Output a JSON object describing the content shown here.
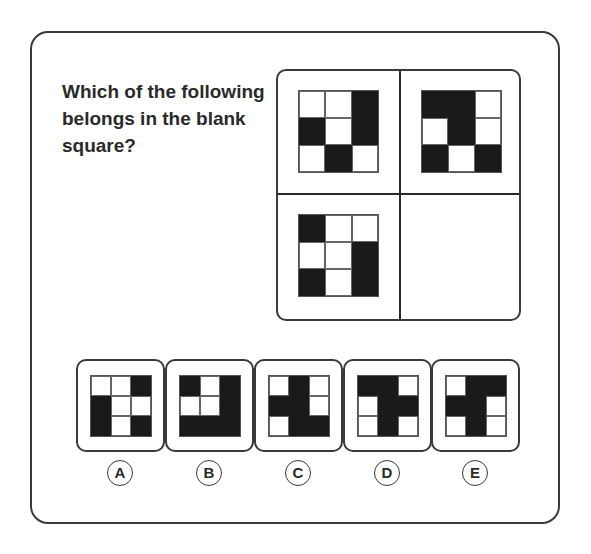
{
  "question": "Which of the following belongs in the blank square?",
  "colors": {
    "filled": "#1a1a1a",
    "empty": "#ffffff",
    "border": "#3a3a3a"
  },
  "matrix": {
    "top_left": [
      [
        0,
        0,
        1
      ],
      [
        1,
        0,
        1
      ],
      [
        0,
        1,
        0
      ]
    ],
    "top_right": [
      [
        1,
        1,
        0
      ],
      [
        0,
        1,
        0
      ],
      [
        1,
        0,
        1
      ]
    ],
    "bottom_left": [
      [
        1,
        0,
        0
      ],
      [
        0,
        0,
        1
      ],
      [
        1,
        0,
        1
      ]
    ],
    "bottom_right": "blank"
  },
  "options": [
    {
      "letter": "A",
      "pattern": [
        [
          0,
          0,
          1
        ],
        [
          1,
          0,
          0
        ],
        [
          1,
          0,
          1
        ]
      ]
    },
    {
      "letter": "B",
      "pattern": [
        [
          1,
          0,
          1
        ],
        [
          0,
          0,
          1
        ],
        [
          1,
          1,
          1
        ]
      ]
    },
    {
      "letter": "C",
      "pattern": [
        [
          0,
          1,
          0
        ],
        [
          1,
          1,
          0
        ],
        [
          0,
          1,
          1
        ]
      ]
    },
    {
      "letter": "D",
      "pattern": [
        [
          1,
          1,
          0
        ],
        [
          0,
          1,
          1
        ],
        [
          0,
          1,
          0
        ]
      ]
    },
    {
      "letter": "E",
      "pattern": [
        [
          0,
          1,
          1
        ],
        [
          1,
          1,
          0
        ],
        [
          0,
          1,
          0
        ]
      ]
    }
  ]
}
